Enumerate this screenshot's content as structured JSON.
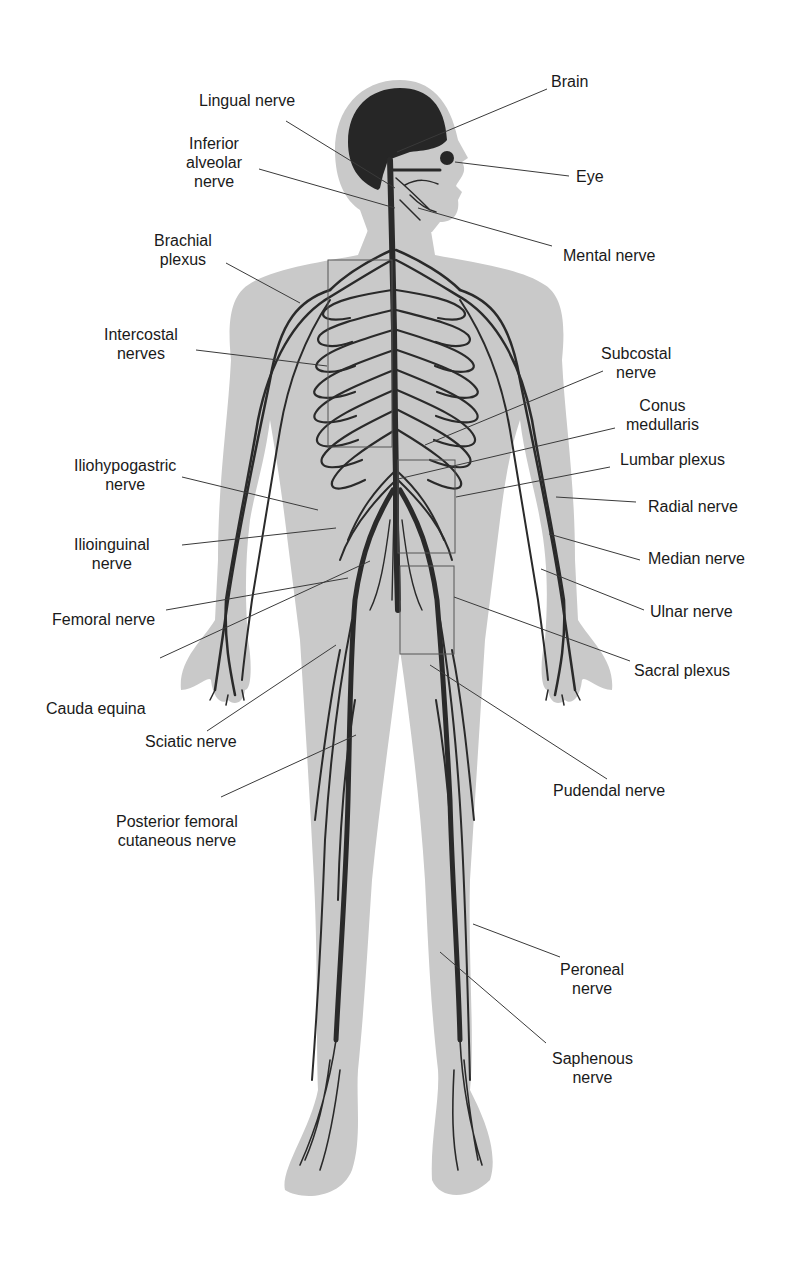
{
  "figure": {
    "colors": {
      "silhouette": "#c9c9c9",
      "nerve": "#2a2a2a",
      "brain": "#262626",
      "leader": "#3a3a3a",
      "text": "#1a1a1a"
    }
  },
  "labels": {
    "brain": {
      "lines": [
        "Brain"
      ]
    },
    "lingual_nerve": {
      "lines": [
        "Lingual nerve"
      ]
    },
    "eye": {
      "lines": [
        "Eye"
      ]
    },
    "inferior_alveolar_nerve": {
      "lines": [
        "Inferior",
        "alveolar",
        "nerve"
      ]
    },
    "mental_nerve": {
      "lines": [
        "Mental nerve"
      ]
    },
    "brachial_plexus": {
      "lines": [
        "Brachial",
        "plexus"
      ]
    },
    "intercostal_nerves": {
      "lines": [
        "Intercostal",
        "nerves"
      ]
    },
    "subcostal_nerve": {
      "lines": [
        "Subcostal",
        "nerve"
      ]
    },
    "conus_medullaris": {
      "lines": [
        "Conus",
        "medullaris"
      ]
    },
    "iliohypogastric_nerve": {
      "lines": [
        "Iliohypogastric",
        "nerve"
      ]
    },
    "lumbar_plexus": {
      "lines": [
        "Lumbar plexus"
      ]
    },
    "radial_nerve": {
      "lines": [
        "Radial nerve"
      ]
    },
    "ilioinguinal_nerve": {
      "lines": [
        "Ilioinguinal",
        "nerve"
      ]
    },
    "median_nerve": {
      "lines": [
        "Median nerve"
      ]
    },
    "femoral_nerve": {
      "lines": [
        "Femoral nerve"
      ]
    },
    "ulnar_nerve": {
      "lines": [
        "Ulnar nerve"
      ]
    },
    "cauda_equina": {
      "lines": [
        "Cauda equina"
      ]
    },
    "sacral_plexus": {
      "lines": [
        "Sacral plexus"
      ]
    },
    "sciatic_nerve": {
      "lines": [
        "Sciatic nerve"
      ]
    },
    "pudendal_nerve": {
      "lines": [
        "Pudendal nerve"
      ]
    },
    "posterior_femoral_cutaneous_nerve": {
      "lines": [
        "Posterior femoral",
        "cutaneous nerve"
      ]
    },
    "peroneal_nerve": {
      "lines": [
        "Peroneal",
        "nerve"
      ]
    },
    "saphenous_nerve": {
      "lines": [
        "Saphenous",
        "nerve"
      ]
    }
  }
}
